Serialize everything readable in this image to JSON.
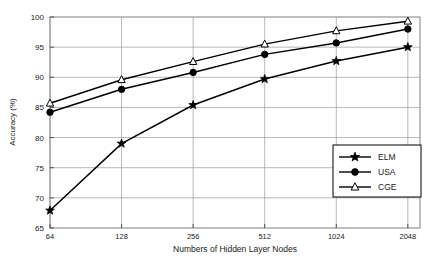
{
  "chart_data": {
    "type": "line",
    "title": "",
    "xlabel": "Numbers of Hidden Layer Nodes",
    "ylabel": "Accuracy (%)",
    "x": [
      64,
      128,
      256,
      512,
      1024,
      2048
    ],
    "x_tick_labels": [
      "64",
      "128",
      "256",
      "512",
      "1024",
      "2048"
    ],
    "x_scale": "log2",
    "xlim": [
      64,
      2304
    ],
    "y_tick_labels": [
      "65",
      "70",
      "75",
      "80",
      "85",
      "90",
      "95",
      "100"
    ],
    "y_ticks": [
      65,
      70,
      75,
      80,
      85,
      90,
      95,
      100
    ],
    "ylim": [
      65,
      100
    ],
    "grid": true,
    "legend_position": "center-right",
    "series": [
      {
        "name": "ELM",
        "marker": "star",
        "marker_fill": "solid",
        "color": "#000000",
        "values": [
          67.9,
          79.0,
          85.4,
          89.7,
          92.7,
          95.0
        ]
      },
      {
        "name": "USA",
        "marker": "circle",
        "marker_fill": "solid",
        "color": "#000000",
        "values": [
          84.2,
          88.0,
          90.8,
          93.8,
          95.7,
          98.0
        ]
      },
      {
        "name": "CGE",
        "marker": "triangle",
        "marker_fill": "open",
        "color": "#000000",
        "values": [
          85.7,
          89.6,
          92.6,
          95.5,
          97.7,
          99.3
        ]
      }
    ]
  },
  "legend": {
    "entries": [
      {
        "label": "ELM"
      },
      {
        "label": "USA"
      },
      {
        "label": "CGE"
      }
    ]
  },
  "axes": {
    "x_title": "Numbers of Hidden Layer Nodes",
    "y_title": "Accuracy (%)"
  }
}
